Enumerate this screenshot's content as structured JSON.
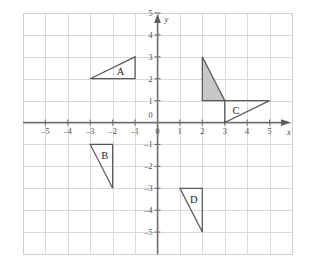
{
  "figure": {
    "title": "",
    "background_color": "#ffffff",
    "grid_color": "#d9d9d9",
    "axis_color": "#6e6e70",
    "outline_color": "#58585a",
    "shaded_fill_color": "#c8c8c8"
  },
  "chart_data": {
    "type": "scatter",
    "title": "",
    "xlabel": "x",
    "ylabel": "y",
    "xlim": [
      -6,
      6
    ],
    "ylim": [
      -6,
      5
    ],
    "grid": true,
    "legend": "none",
    "x_ticks": [
      -5,
      -4,
      -3,
      -2,
      -1,
      0,
      1,
      2,
      3,
      4,
      5
    ],
    "x_tick_labels": [
      "-5",
      "-4",
      "-3",
      "-2",
      "-1",
      "0",
      "1",
      "2",
      "3",
      "4",
      "5"
    ],
    "y_ticks": [
      -5,
      -4,
      -3,
      -2,
      -1,
      0,
      1,
      2,
      3,
      4,
      5
    ],
    "y_tick_labels": [
      "-5",
      "-4",
      "-3",
      "-2",
      "-1",
      "0",
      "1",
      "2",
      "3",
      "4",
      "5"
    ],
    "axis_arrows": [
      "x-positive",
      "y-positive"
    ],
    "shapes": [
      {
        "label": "A",
        "kind": "triangle",
        "filled": false,
        "vertices": [
          [
            -3,
            2
          ],
          [
            -1,
            2
          ],
          [
            -1,
            3
          ]
        ],
        "label_position": [
          -1.65,
          2.35
        ]
      },
      {
        "label": "B",
        "kind": "triangle",
        "filled": false,
        "vertices": [
          [
            -3,
            -1
          ],
          [
            -2,
            -1
          ],
          [
            -2,
            -3
          ]
        ],
        "label_position": [
          -2.35,
          -1.5
        ]
      },
      {
        "label": "C",
        "kind": "triangle",
        "filled": false,
        "vertices": [
          [
            3,
            1
          ],
          [
            5,
            1
          ],
          [
            3,
            0
          ]
        ],
        "label_position": [
          3.5,
          0.55
        ]
      },
      {
        "label": "D",
        "kind": "triangle",
        "filled": false,
        "vertices": [
          [
            1,
            -3
          ],
          [
            2,
            -3
          ],
          [
            2,
            -5
          ]
        ],
        "label_position": [
          1.62,
          -3.5
        ]
      },
      {
        "label": "",
        "kind": "triangle",
        "filled": true,
        "vertices": [
          [
            2,
            3
          ],
          [
            2,
            1
          ],
          [
            3,
            1
          ]
        ],
        "label_position": null
      }
    ]
  },
  "axis_labels": {
    "x_axis_name": "x",
    "y_axis_name": "y"
  }
}
